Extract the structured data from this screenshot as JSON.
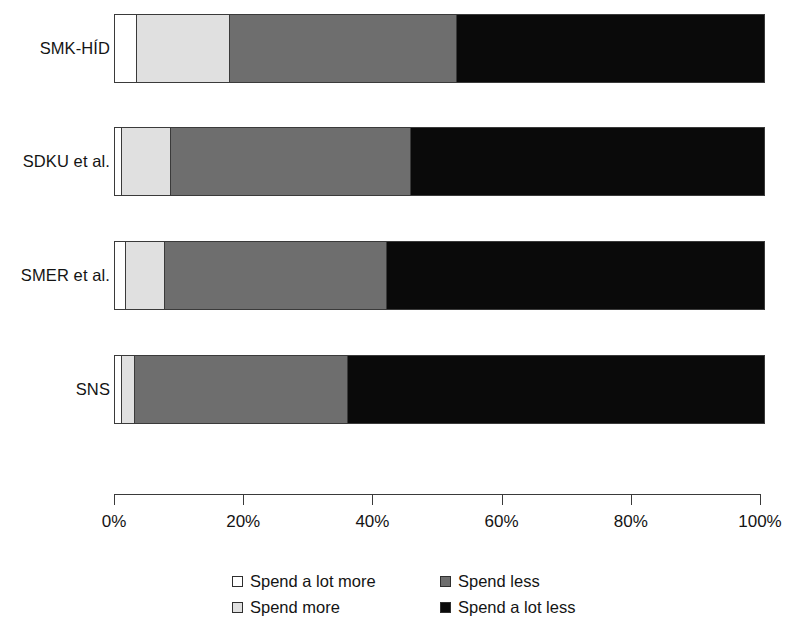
{
  "chart_data": {
    "type": "bar",
    "orientation": "horizontal",
    "stacked": true,
    "normalized": true,
    "title": "",
    "xlabel": "",
    "ylabel": "",
    "xlim": [
      0,
      100
    ],
    "grid": false,
    "legend_position": "bottom",
    "categories": [
      "SMK-HÍD",
      "SDKU et al.",
      "SMER et al.",
      "SNS"
    ],
    "series": [
      {
        "name": "Spend a lot more",
        "color": "#ffffff",
        "values": [
          3.2,
          1.0,
          1.5,
          1.0
        ]
      },
      {
        "name": "Spend more",
        "color": "#e0e0e0",
        "values": [
          14.4,
          7.5,
          6.1,
          2.0
        ]
      },
      {
        "name": "Spend less",
        "color": "#6e6e6e",
        "values": [
          34.9,
          37.0,
          34.2,
          32.8
        ]
      },
      {
        "name": "Spend a lot less",
        "color": "#0a0a0a",
        "values": [
          47.5,
          54.5,
          58.2,
          64.2
        ]
      }
    ],
    "axis": {
      "ticks": [
        0,
        20,
        40,
        60,
        80,
        100
      ],
      "tick_labels": [
        "0%",
        "20%",
        "40%",
        "60%",
        "80%",
        "100%"
      ]
    },
    "legend": [
      {
        "label": "Spend a lot more",
        "swatch": "sw-lotmore"
      },
      {
        "label": "Spend less",
        "swatch": "sw-less"
      },
      {
        "label": "Spend more",
        "swatch": "sw-more"
      },
      {
        "label": "Spend a lot less",
        "swatch": "sw-lotless"
      }
    ]
  }
}
